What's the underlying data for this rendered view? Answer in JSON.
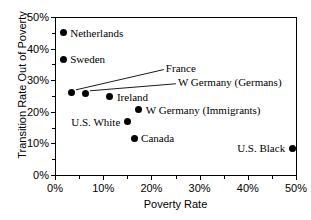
{
  "chart_data": {
    "type": "scatter",
    "title": "",
    "xlabel": "Poverty Rate",
    "ylabel": "Transition Rate Out of Poverty",
    "xlim": [
      0,
      50
    ],
    "ylim": [
      0,
      50
    ],
    "grid": false,
    "legend": "none (direct point labels)",
    "x_ticks": [
      "0%",
      "10%",
      "20%",
      "30%",
      "40%",
      "50%"
    ],
    "x_tick_values": [
      0,
      10,
      20,
      30,
      40,
      50
    ],
    "x_minor_tick_values": [
      5,
      15,
      25,
      35,
      45
    ],
    "y_ticks": [
      "0%",
      "10%",
      "20%",
      "30%",
      "40%",
      "50%"
    ],
    "y_tick_values": [
      0,
      10,
      20,
      30,
      40,
      50
    ],
    "y_minor_tick_values": [
      5,
      15,
      25,
      35,
      45
    ],
    "points": [
      {
        "name": "Netherlands",
        "x": 1.7,
        "y": 45.0,
        "label": "Netherlands",
        "label_side": "right",
        "leader": false
      },
      {
        "name": "Sweden",
        "x": 1.7,
        "y": 36.7,
        "label": "Sweden",
        "label_side": "right",
        "leader": false
      },
      {
        "name": "France",
        "x": 3.5,
        "y": 26.0,
        "label": "France",
        "label_side": "right",
        "leader": true,
        "label_x": 23.0,
        "label_y": 34.0
      },
      {
        "name": "W Germany (Germans)",
        "x": 6.4,
        "y": 25.7,
        "label": "W Germany (Germans)",
        "label_side": "right",
        "leader": true,
        "label_x": 25.5,
        "label_y": 29.5
      },
      {
        "name": "Ireland",
        "x": 11.4,
        "y": 24.7,
        "label": "Ireland",
        "label_side": "right",
        "leader": false
      },
      {
        "name": "W Germany (Immigrants)",
        "x": 17.4,
        "y": 20.6,
        "label": "W Germany (Immigrants)",
        "label_side": "right",
        "leader": false
      },
      {
        "name": "U.S. White",
        "x": 15.0,
        "y": 16.8,
        "label": "U.S. White",
        "label_side": "left",
        "leader": false
      },
      {
        "name": "Canada",
        "x": 16.4,
        "y": 11.7,
        "label": "Canada",
        "label_side": "right",
        "leader": false
      },
      {
        "name": "U.S. Black",
        "x": 49.2,
        "y": 8.5,
        "label": "U.S. Black",
        "label_side": "left",
        "leader": false
      }
    ]
  },
  "colors": {
    "point": "#000000",
    "axis": "#000000",
    "background": "#ffffff"
  }
}
